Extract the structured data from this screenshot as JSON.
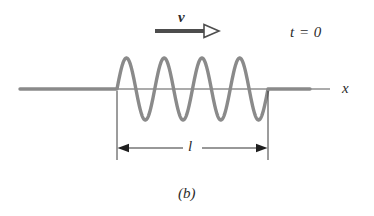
{
  "figure": {
    "caption": "(b)",
    "time_label": "t = 0",
    "velocity_label": "v",
    "axis_label": "x",
    "length_label": "l",
    "colors": {
      "string": "#8a8a8a",
      "axis": "#595959",
      "arrow": "#4d4d4d",
      "dimension": "#333333",
      "background": "#ffffff",
      "text": "#2b2b2b"
    }
  },
  "chart_data": {
    "type": "line",
    "title": "(b)",
    "xlabel": "x",
    "ylabel": "",
    "grid": false,
    "legend": null,
    "annotations": [
      {
        "name": "velocity-vector",
        "text": "v",
        "x": 183,
        "y": 18,
        "description": "bold italic v above rightward arrow indicating wave propagation direction"
      },
      {
        "name": "time-stamp",
        "text": "t = 0",
        "x": 295,
        "y": 33,
        "description": "snapshot time label"
      },
      {
        "name": "pulse-length",
        "text": "l",
        "x": 192,
        "y": 147,
        "description": "length of the wave train marked by a double-headed dimension line"
      },
      {
        "name": "panel-caption",
        "text": "(b)",
        "x": 187,
        "y": 194,
        "description": "figure panel caption"
      }
    ],
    "axis": {
      "y_pixel": 89,
      "x_start_pixel": 20,
      "x_end_pixel": 330,
      "label": "x"
    },
    "string": {
      "description": "Transverse wave train of finite length l on a string; flat outside the pulse region.",
      "flat_left": {
        "x_start": 20,
        "x_end": 117
      },
      "wave_region": {
        "x_start": 117,
        "x_end": 268
      },
      "flat_right": {
        "x_start": 268,
        "x_end": 310
      },
      "cycles": 4,
      "wavelength_pixels": 37.75,
      "amplitude_pixels": 31,
      "first_extremum": "peak",
      "baseline_y": 89
    },
    "velocity_arrow": {
      "x_start": 155,
      "x_end": 212,
      "y": 31,
      "head_style": "hollow-outline-triangle",
      "direction": "right"
    },
    "dimension_line": {
      "y": 148,
      "x_start": 117,
      "x_end": 268,
      "head_style": "solid-filled-triangle",
      "direction": "both",
      "extension_lines": [
        {
          "x": 117,
          "y_top": 91,
          "y_bottom": 160
        },
        {
          "x": 268,
          "y_top": 91,
          "y_bottom": 160
        }
      ]
    }
  }
}
